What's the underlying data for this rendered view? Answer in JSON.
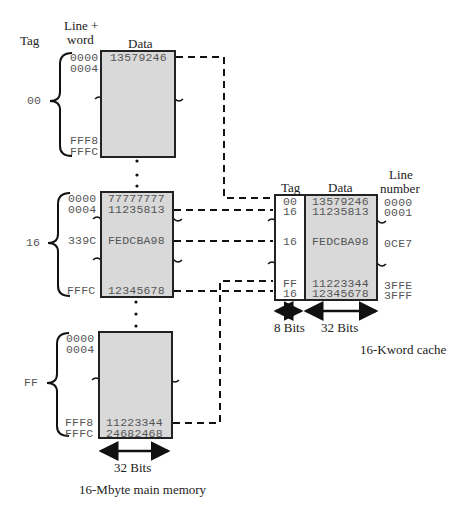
{
  "main_memory": {
    "caption": "16-Mbyte main memory",
    "headers": {
      "tag": "Tag",
      "line_word_1": "Line +",
      "line_word_2": "word",
      "data": "Data"
    },
    "width_label": "32 Bits",
    "blocks": [
      {
        "tag": "00",
        "rows": [
          {
            "addr": "0000",
            "data": "13579246"
          },
          {
            "addr": "0004",
            "data": ""
          },
          {
            "addr": "FFF8",
            "data": ""
          },
          {
            "addr": "FFFC",
            "data": ""
          }
        ]
      },
      {
        "tag": "16",
        "rows": [
          {
            "addr": "0000",
            "data": "77777777"
          },
          {
            "addr": "0004",
            "data": "11235813"
          },
          {
            "addr": "339C",
            "data": "FEDCBA98"
          },
          {
            "addr": "FFFC",
            "data": "12345678"
          }
        ]
      },
      {
        "tag": "FF",
        "rows": [
          {
            "addr": "0000",
            "data": ""
          },
          {
            "addr": "0004",
            "data": ""
          },
          {
            "addr": "FFF8",
            "data": "11223344"
          },
          {
            "addr": "FFFC",
            "data": "24682468"
          }
        ]
      }
    ]
  },
  "cache": {
    "caption": "16-Kword cache",
    "headers": {
      "tag": "Tag",
      "data": "Data",
      "line_1": "Line",
      "line_2": "number"
    },
    "tag_width_label": "8 Bits",
    "data_width_label": "32 Bits",
    "rows": [
      {
        "tag": "00",
        "data": "13579246",
        "line": "0000"
      },
      {
        "tag": "16",
        "data": "11235813",
        "line": "0001"
      },
      {
        "tag": "16",
        "data": "FEDCBA98",
        "line": "0CE7"
      },
      {
        "tag": "FF",
        "data": "11223344",
        "line": "3FFE"
      },
      {
        "tag": "16",
        "data": "12345678",
        "line": "3FFF"
      }
    ]
  }
}
